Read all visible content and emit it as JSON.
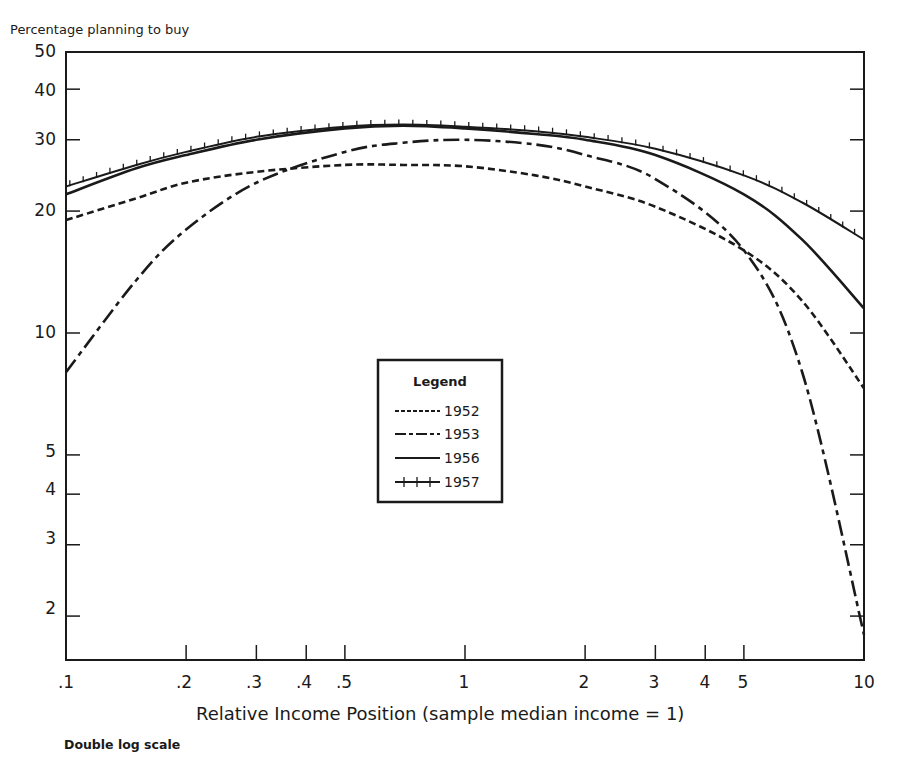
{
  "chart_data": {
    "type": "line",
    "title": "",
    "ylabel": "Percentage planning to buy",
    "xlabel": "Relative Income Position (sample median income = 1)",
    "note": "Double log scale",
    "xscale": "log",
    "yscale": "log",
    "xlim": [
      0.1,
      10
    ],
    "ylim": [
      1.5,
      50
    ],
    "xticks": [
      ".1",
      ".2",
      ".3",
      ".4",
      ".5",
      "1",
      "2",
      "3",
      "4",
      "5",
      "10"
    ],
    "yticks": [
      "50",
      "40",
      "30",
      "20",
      "10",
      "5",
      "4",
      "3",
      "2"
    ],
    "grid": false,
    "legend": {
      "title": "Legend",
      "position": "center",
      "entries": [
        "1952",
        "1953",
        "1956",
        "1957"
      ]
    },
    "x": [
      0.1,
      0.15,
      0.2,
      0.3,
      0.5,
      0.7,
      1,
      1.5,
      2,
      3,
      5,
      7,
      10
    ],
    "series": [
      {
        "name": "1952",
        "style": "dashed",
        "values": [
          19,
          21.5,
          23.5,
          25,
          26,
          26,
          25.8,
          24.5,
          23,
          20.5,
          16,
          12,
          7.3
        ]
      },
      {
        "name": "1953",
        "style": "dash-dot",
        "values": [
          8,
          13.5,
          18,
          23.5,
          28,
          29.5,
          30,
          29.2,
          27.5,
          24,
          16,
          8,
          1.8
        ]
      },
      {
        "name": "1956",
        "style": "solid",
        "values": [
          22,
          25.5,
          27.5,
          30,
          32,
          32.5,
          32,
          31,
          30,
          27.5,
          22,
          17,
          11.5
        ]
      },
      {
        "name": "1957",
        "style": "solid-ticked",
        "values": [
          23,
          26,
          28,
          30.5,
          32.3,
          32.7,
          32.3,
          31.5,
          30.5,
          28.5,
          24.5,
          21,
          17
        ]
      }
    ]
  },
  "labels": {
    "ylabel": "Percentage planning to buy",
    "xlabel": "Relative Income Position (sample median income = 1)",
    "note": "Double log scale",
    "legend_title": "Legend",
    "legend": [
      "1952",
      "1953",
      "1956",
      "1957"
    ],
    "yticks": [
      "50",
      "40",
      "30",
      "20",
      "10",
      "5",
      "4",
      "3",
      "2"
    ],
    "xticks": [
      ".1",
      ".2",
      ".3",
      ".4",
      ".5",
      "1",
      "2",
      "3",
      "4",
      "5",
      "10"
    ]
  }
}
